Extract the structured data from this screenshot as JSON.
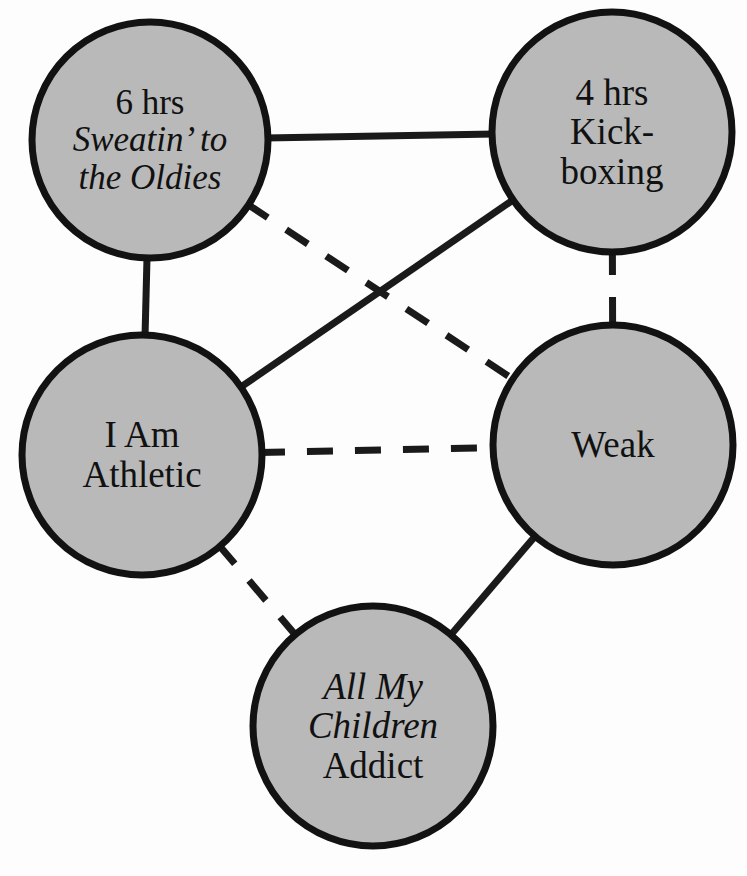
{
  "diagram": {
    "type": "undirected-graph",
    "title": "",
    "background_color": "#fdfdfd",
    "node_fill_color": "#b9b9b9",
    "node_stroke_color": "#121212",
    "edge_color": "#1a1a1a",
    "nodes": [
      {
        "id": "sweatin",
        "name": "sweatin-to-the-oldies-node",
        "cx": 150,
        "cy": 140,
        "r": 118,
        "lines": [
          {
            "text": "6 hrs",
            "style": "reg"
          },
          {
            "text": "Sweatin’ to",
            "style": "ital"
          },
          {
            "text": "the Oldies",
            "style": "ital"
          }
        ],
        "font_size": 35
      },
      {
        "id": "kickboxing",
        "name": "kickboxing-node",
        "cx": 612,
        "cy": 132,
        "r": 120,
        "lines": [
          {
            "text": "4 hrs",
            "style": "reg"
          },
          {
            "text": "Kick-",
            "style": "reg"
          },
          {
            "text": "boxing",
            "style": "reg"
          }
        ],
        "font_size": 37
      },
      {
        "id": "athletic",
        "name": "i-am-athletic-node",
        "cx": 142,
        "cy": 455,
        "r": 120,
        "lines": [
          {
            "text": "I Am",
            "style": "reg"
          },
          {
            "text": "Athletic",
            "style": "reg"
          }
        ],
        "font_size": 37
      },
      {
        "id": "weak",
        "name": "weak-node",
        "cx": 613,
        "cy": 445,
        "r": 120,
        "lines": [
          {
            "text": "Weak",
            "style": "reg"
          }
        ],
        "font_size": 37
      },
      {
        "id": "addict",
        "name": "all-my-children-addict-node",
        "cx": 373,
        "cy": 726,
        "r": 120,
        "lines": [
          {
            "text": "All My",
            "style": "ital"
          },
          {
            "text": "Children",
            "style": "ital"
          },
          {
            "text": "Addict",
            "style": "reg"
          }
        ],
        "font_size": 37
      }
    ],
    "edges": [
      {
        "name": "edge-sweatin-kickboxing",
        "from": "sweatin",
        "to": "kickboxing",
        "style": "solid"
      },
      {
        "name": "edge-sweatin-athletic",
        "from": "sweatin",
        "to": "athletic",
        "style": "solid"
      },
      {
        "name": "edge-athletic-kickboxing",
        "from": "athletic",
        "to": "kickboxing",
        "style": "solid"
      },
      {
        "name": "edge-sweatin-weak",
        "from": "sweatin",
        "to": "weak",
        "style": "dashed"
      },
      {
        "name": "edge-kickboxing-weak",
        "from": "kickboxing",
        "to": "weak",
        "style": "dashed"
      },
      {
        "name": "edge-athletic-weak",
        "from": "athletic",
        "to": "weak",
        "style": "dashed"
      },
      {
        "name": "edge-athletic-addict",
        "from": "athletic",
        "to": "addict",
        "style": "dashed"
      },
      {
        "name": "edge-weak-addict",
        "from": "weak",
        "to": "addict",
        "style": "solid"
      }
    ]
  }
}
